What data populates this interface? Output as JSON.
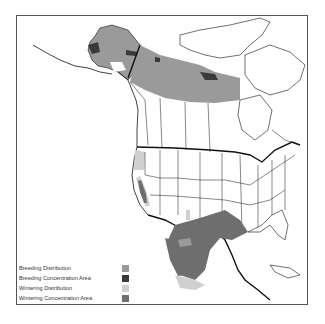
{
  "map": {
    "region": "North America",
    "colors": {
      "breeding_distribution": "#9a9a9a",
      "breeding_concentration": "#3a3a3a",
      "wintering_distribution": "#cfcfcf",
      "wintering_concentration": "#6e6e6e",
      "land": "#ffffff",
      "border": "#111111"
    }
  },
  "legend": {
    "items": [
      {
        "label": "Breeding Distribution",
        "color": "#9a9a9a"
      },
      {
        "label": "Breeding Concentration Area",
        "color": "#3a3a3a"
      },
      {
        "label": "Wintering Distribution",
        "color": "#cfcfcf"
      },
      {
        "label": "Wintering Concentration Area",
        "color": "#6e6e6e"
      }
    ]
  }
}
